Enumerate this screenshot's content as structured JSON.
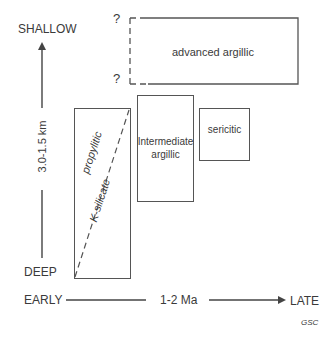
{
  "diagram": {
    "type": "alteration-zoning-timeline",
    "y_axis": {
      "top_label": "SHALLOW",
      "bottom_label": "DEEP",
      "range_label": "3.0-1.5 km"
    },
    "x_axis": {
      "left_label": "EARLY",
      "right_label": "LATE",
      "duration_label": "1-2 Ma"
    },
    "zones": [
      {
        "id": "advanced-argillic",
        "label": "advanced argillic",
        "uncertain_marks": [
          "?",
          "?"
        ]
      },
      {
        "id": "propylitic",
        "label": "propylitic"
      },
      {
        "id": "k-silicate",
        "label": "K-silicate"
      },
      {
        "id": "intermediate-argillic",
        "label_line1": "Intermediate",
        "label_line2": "argillic"
      },
      {
        "id": "sericitic",
        "label": "sericitic"
      }
    ],
    "credit": "GSC",
    "colors": {
      "line": "#555555",
      "text": "#3a3a3a",
      "background": "#ffffff"
    }
  }
}
